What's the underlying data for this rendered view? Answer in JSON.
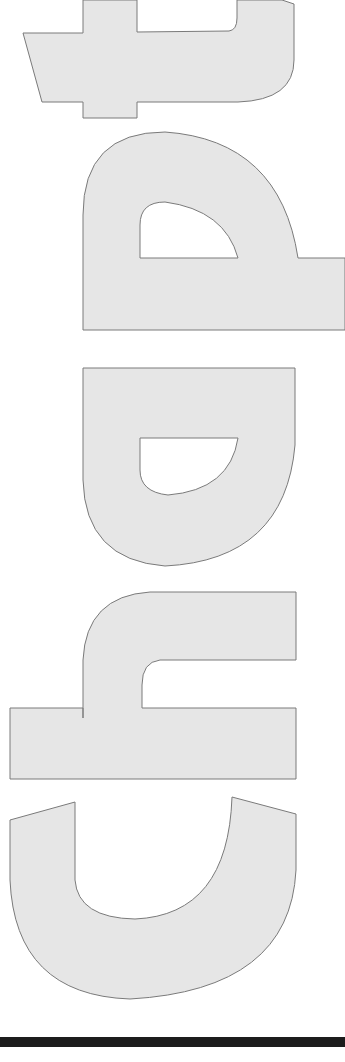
{
  "page": {
    "heading_word": "chapt",
    "heading_orientation": "rotated 90° clockwise, read bottom-to-top",
    "letters": [
      "c",
      "h",
      "a",
      "p",
      "t"
    ],
    "colors": {
      "letter_fill": "#e6e6e6",
      "letter_outline": "#7a7a7a",
      "rule": "#1c1c1c",
      "background": "#ffffff"
    }
  }
}
